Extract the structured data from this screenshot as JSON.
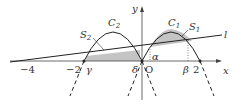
{
  "diagram": {
    "axes": {
      "x_label": "x",
      "y_label": "y",
      "origin_label": "O",
      "tick_labels": [
        "−4",
        "−2",
        "2"
      ]
    },
    "curves": {
      "C1": {
        "name": "C",
        "sub": "1"
      },
      "C2": {
        "name": "C",
        "sub": "2"
      },
      "line": {
        "name": "l"
      }
    },
    "regions": {
      "S1": {
        "name": "S",
        "sub": "1"
      },
      "S2": {
        "name": "S",
        "sub": "2"
      }
    },
    "points": {
      "alpha": "α",
      "beta": "β",
      "gamma": "γ",
      "delta": "δ"
    },
    "colors": {
      "stroke": "#222222",
      "shade": "#c4c4c4",
      "axis": "#444444"
    }
  }
}
